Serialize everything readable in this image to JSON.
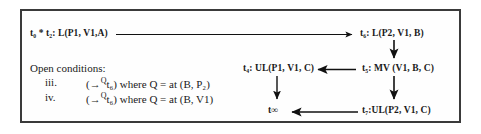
{
  "figure": {
    "title_absent": true,
    "border_color": "#3a3a3a",
    "text_color": "#1a1a1a"
  },
  "nodes": {
    "t0_t2": "t₀ * t₂: L(P1, V1,A)",
    "t6": "t₆: L(P2, V1, B)",
    "t4": "t₄: UL(P1, V1, C)",
    "t5": "t₅: MV (V1, B, C)",
    "t_inf": "t∞",
    "t7": "t₇:UL(P2, V1, C)"
  },
  "open_conditions": {
    "heading": "Open conditions:",
    "items": [
      {
        "numeral": "iii.",
        "arrow": "→",
        "superscript": "Q",
        "target": "t₆",
        "text": ") where Q = at (B, P₂)",
        "open_paren": "("
      },
      {
        "numeral": "iv.",
        "arrow": "→",
        "superscript": "Q",
        "target": "t₆",
        "text": ") where Q = at (B, V1)",
        "open_paren": "("
      }
    ]
  },
  "edges": [
    {
      "name": "t0t2-to-t6",
      "from": "t₀ * t₂: L(P1, V1,A)",
      "to": "t₆: L(P2, V1, B)",
      "direction": "right"
    },
    {
      "name": "t6-to-t5",
      "from": "t₆: L(P2, V1, B)",
      "to": "t₅: MV (V1, B, C)",
      "direction": "down"
    },
    {
      "name": "t5-to-t4",
      "from": "t₅: MV (V1, B, C)",
      "to": "t₄: UL(P1, V1, C)",
      "direction": "left"
    },
    {
      "name": "t4-to-tinf",
      "from": "t₄: UL(P1, V1, C)",
      "to": "t∞",
      "direction": "down"
    },
    {
      "name": "t5-to-t7",
      "from": "t₅: MV (V1, B, C)",
      "to": "t₇:UL(P2, V1, C)",
      "direction": "down"
    },
    {
      "name": "t7-to-tinf",
      "from": "t₇:UL(P2, V1, C)",
      "to": "t∞",
      "direction": "left"
    }
  ]
}
